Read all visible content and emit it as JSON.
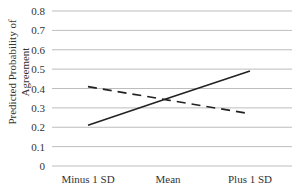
{
  "chart_data": {
    "type": "line",
    "title": "",
    "xlabel": "",
    "ylabel": "Predicted Probability of Agreement",
    "ylabel_lines": [
      "Predicted Probability of",
      "Agreement"
    ],
    "categories": [
      "Minus 1 SD",
      "Mean",
      "Plus 1 SD"
    ],
    "yticks": [
      "0",
      "0.1",
      "0.2",
      "0.3",
      "0.4",
      "0.5",
      "0.6",
      "0.7",
      "0.8"
    ],
    "ylim": [
      0,
      0.8
    ],
    "grid": true,
    "legend": null,
    "series": [
      {
        "name": "solid",
        "style": "solid",
        "color": "#222222",
        "values": [
          0.21,
          0.35,
          0.49
        ]
      },
      {
        "name": "dashed",
        "style": "dashed",
        "color": "#222222",
        "values": [
          0.41,
          0.34,
          0.27
        ]
      }
    ]
  },
  "colors": {
    "grid": "#bdbdbd",
    "line": "#222222",
    "text": "#333333"
  }
}
